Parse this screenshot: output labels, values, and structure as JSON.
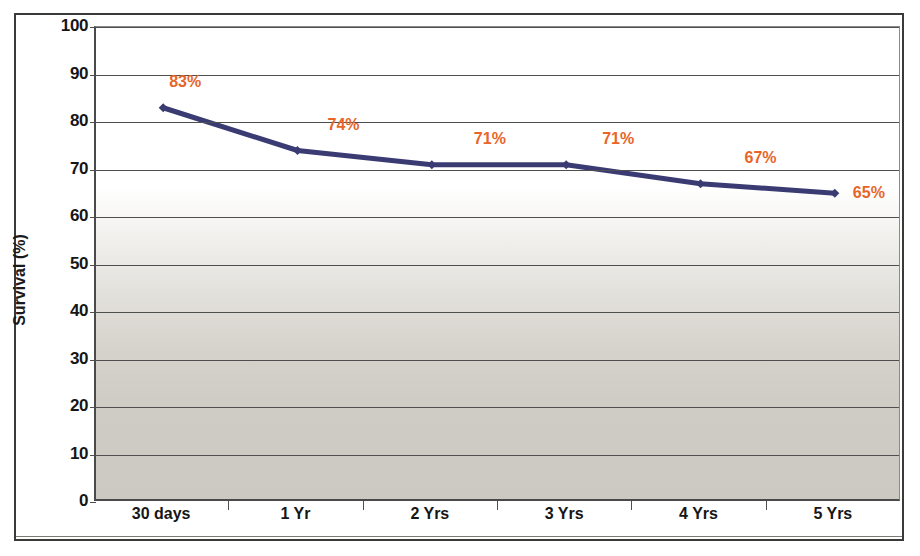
{
  "chart_data": {
    "type": "line",
    "title": "",
    "xlabel": "",
    "ylabel": "Survival (%)",
    "categories": [
      "30 days",
      "1 Yr",
      "2 Yrs",
      "3 Yrs",
      "4 Yrs",
      "5 Yrs"
    ],
    "values": [
      83,
      74,
      71,
      71,
      67,
      65
    ],
    "data_labels": [
      "83%",
      "74%",
      "71%",
      "71%",
      "67%",
      "65%"
    ],
    "ylim": [
      0,
      100
    ],
    "ytick_step": 10,
    "yticks": [
      100,
      90,
      80,
      70,
      60,
      50,
      40,
      30,
      20,
      10,
      0
    ],
    "ytick_labels": [
      "100",
      "90",
      "80",
      "70",
      "60",
      "50",
      "40",
      "30",
      "20",
      "10",
      "0"
    ],
    "grid": "horizontal",
    "legend": "none",
    "series": [
      {
        "name": "Survival",
        "values": [
          83,
          74,
          71,
          71,
          67,
          65
        ],
        "color": "#3b3b73",
        "marker": "diamond"
      }
    ],
    "colors": {
      "line": "#3b3b73",
      "data_label": "#e8652a",
      "axis": "#4a4a4a",
      "gridline": "#4f4f4f",
      "plot_top": "#ffffff",
      "plot_bottom": "#ccc9c2"
    }
  }
}
